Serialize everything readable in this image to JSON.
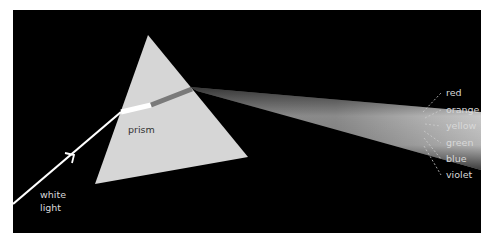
{
  "diagram": {
    "labels": {
      "incoming": [
        "white",
        "light"
      ],
      "prism": "prism"
    },
    "spectrum": [
      {
        "name": "red"
      },
      {
        "name": "orange"
      },
      {
        "name": "yellow"
      },
      {
        "name": "green"
      },
      {
        "name": "blue"
      },
      {
        "name": "violet"
      }
    ],
    "colors": {
      "background": "#000000",
      "prism": "#d9d9d9",
      "beam": "#ffffff",
      "label": "#d8d8d8"
    }
  }
}
